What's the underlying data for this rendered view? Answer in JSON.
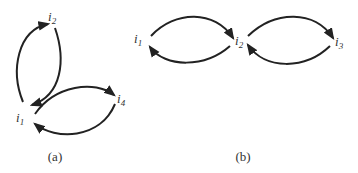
{
  "diagram_a": {
    "caption": "(a)",
    "nodes": [
      {
        "id": "i2",
        "base": "i",
        "sub": "2"
      },
      {
        "id": "i1",
        "base": "i",
        "sub": "1"
      },
      {
        "id": "i4",
        "base": "i",
        "sub": "4"
      }
    ],
    "edges": [
      {
        "from": "i1",
        "to": "i2"
      },
      {
        "from": "i2",
        "to": "i1"
      },
      {
        "from": "i1",
        "to": "i4"
      },
      {
        "from": "i4",
        "to": "i1"
      }
    ]
  },
  "diagram_b": {
    "caption": "(b)",
    "nodes": [
      {
        "id": "i1",
        "base": "i",
        "sub": "1"
      },
      {
        "id": "i2",
        "base": "i",
        "sub": "2"
      },
      {
        "id": "i3",
        "base": "i",
        "sub": "3"
      }
    ],
    "edges": [
      {
        "from": "i1",
        "to": "i2"
      },
      {
        "from": "i2",
        "to": "i1"
      },
      {
        "from": "i2",
        "to": "i3"
      },
      {
        "from": "i3",
        "to": "i2"
      }
    ]
  },
  "colors": {
    "stroke": "#222222",
    "text": "#333333",
    "background": "#ffffff"
  }
}
